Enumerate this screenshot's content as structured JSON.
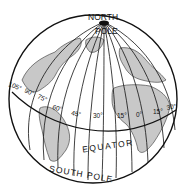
{
  "diagram": {
    "type": "globe",
    "colors": {
      "line": "#111111",
      "land": "#bdbdbd",
      "background": "#ffffff"
    },
    "labels": {
      "north": "NORTH",
      "pole": "POLE",
      "equator": "EQUATOR",
      "south_pole": "SOUTH POLE"
    },
    "longitudes": [
      {
        "label": "105°",
        "x": 8,
        "y": 86,
        "rot": 20
      },
      {
        "label": "90°",
        "x": 24,
        "y": 92,
        "rot": 25
      },
      {
        "label": "75°",
        "x": 37,
        "y": 98,
        "rot": 25
      },
      {
        "label": "60°",
        "x": 52,
        "y": 109,
        "rot": 15
      },
      {
        "label": "45°",
        "x": 71,
        "y": 115,
        "rot": 10
      },
      {
        "label": "30°",
        "x": 93,
        "y": 118,
        "rot": 0
      },
      {
        "label": "15°",
        "x": 117,
        "y": 118,
        "rot": 0
      },
      {
        "label": "0°",
        "x": 136,
        "y": 117,
        "rot": 0
      },
      {
        "label": "15°",
        "x": 153,
        "y": 114,
        "rot": 0
      },
      {
        "label": "30°",
        "x": 167,
        "y": 110,
        "rot": -10
      }
    ]
  }
}
